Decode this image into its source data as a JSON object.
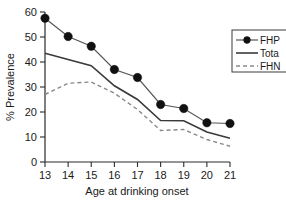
{
  "chart_data": {
    "type": "line",
    "title": "",
    "xlabel": "Age at drinking onset",
    "ylabel": "% Prevalence",
    "x": [
      13,
      14,
      15,
      16,
      17,
      18,
      19,
      20,
      21
    ],
    "xlim": [
      13,
      21
    ],
    "ylim": [
      0,
      60
    ],
    "xticks": [
      "13",
      "14",
      "15",
      "16",
      "17",
      "18",
      "19",
      "20",
      "21"
    ],
    "yticks": [
      "0",
      "10",
      "20",
      "30",
      "40",
      "50",
      "60"
    ],
    "grid": false,
    "legend_position": "right",
    "series": [
      {
        "name": "FHP",
        "style": "line-markers",
        "color": "#555555",
        "marker": "filled-circle",
        "values": [
          57.5,
          50.2,
          46.3,
          37.0,
          33.8,
          23.0,
          21.4,
          15.7,
          15.4
        ]
      },
      {
        "name": "Tota",
        "style": "solid",
        "color": "#3a3a3a",
        "marker": "none",
        "values": [
          43.5,
          41.0,
          38.5,
          30.5,
          25.0,
          16.6,
          16.5,
          12.0,
          9.5
        ]
      },
      {
        "name": "FHN",
        "style": "dashed",
        "color": "#8a8a8a",
        "marker": "none",
        "values": [
          27.0,
          31.5,
          32.0,
          27.5,
          21.0,
          12.6,
          13.0,
          9.0,
          6.3
        ]
      }
    ]
  },
  "legend": {
    "entries": [
      {
        "label": "FHP"
      },
      {
        "label": "Tota"
      },
      {
        "label": "FHN"
      }
    ]
  },
  "axes": {
    "x_title": "Age at drinking onset",
    "y_title": "% Prevalence"
  }
}
